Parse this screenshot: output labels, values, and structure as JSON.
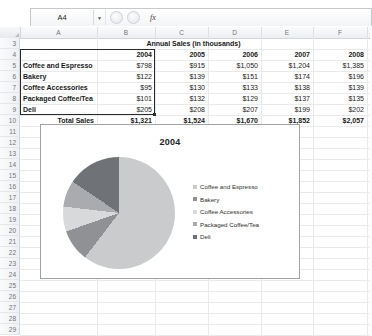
{
  "app": {
    "name_box_value": "A4",
    "namebox_arrow_icon": "chevron-down-icon",
    "cancel_icon": "cancel-icon",
    "enter_icon": "enter-icon",
    "function_icon": "fx-icon",
    "function_label": "fx",
    "formula_value": ""
  },
  "grid": {
    "column_headers": [
      "A",
      "B",
      "C",
      "D",
      "E",
      "F"
    ],
    "row_headers": [
      "3",
      "4",
      "5",
      "6",
      "7",
      "8",
      "9",
      "10",
      "11",
      "12",
      "13",
      "14",
      "15",
      "16",
      "17",
      "18",
      "19",
      "20",
      "21",
      "22",
      "23",
      "24",
      "25",
      "26",
      "27",
      "28",
      "29"
    ],
    "title_row": {
      "row": "3",
      "text": "Annual Sales (in thousands)"
    },
    "header_row": {
      "row": "4",
      "label": "",
      "years": [
        "2004",
        "2005",
        "2006",
        "2007",
        "2008"
      ]
    },
    "data_rows": [
      {
        "row": "5",
        "category": "Coffee and Espresso",
        "values": [
          "$798",
          "$915",
          "$1,050",
          "$1,204",
          "$1,385"
        ]
      },
      {
        "row": "6",
        "category": "Bakery",
        "values": [
          "$122",
          "$139",
          "$151",
          "$174",
          "$196"
        ]
      },
      {
        "row": "7",
        "category": "Coffee Accessories",
        "values": [
          "$95",
          "$130",
          "$133",
          "$138",
          "$139"
        ]
      },
      {
        "row": "8",
        "category": "Packaged Coffee/Tea",
        "values": [
          "$101",
          "$132",
          "$129",
          "$137",
          "$135"
        ]
      },
      {
        "row": "9",
        "category": "Deli",
        "values": [
          "$205",
          "$208",
          "$207",
          "$199",
          "$202"
        ]
      }
    ],
    "total_row": {
      "row": "10",
      "label": "Total Sales",
      "values": [
        "$1,321",
        "$1,524",
        "$1,670",
        "$1,852",
        "$2,057"
      ]
    },
    "selection_range": "A4:B9"
  },
  "chart_data": {
    "type": "pie",
    "title": "2004",
    "categories": [
      "Coffee and Espresso",
      "Bakery",
      "Coffee Accessories",
      "Packaged Coffee/Tea",
      "Deli"
    ],
    "values": [
      798,
      122,
      95,
      101,
      205
    ],
    "total": 1321,
    "percentages": [
      60.4,
      9.2,
      7.2,
      7.6,
      15.5
    ],
    "colors": [
      "#c9cbcd",
      "#8f9195",
      "#d7d9db",
      "#a9abae",
      "#6f7276"
    ],
    "legend_position": "right",
    "xlabel": "",
    "ylabel": ""
  }
}
